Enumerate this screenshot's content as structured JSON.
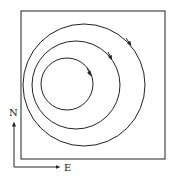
{
  "diagram": {
    "loops": [
      {
        "name": "outer-loop",
        "direction": "clockwise"
      },
      {
        "name": "middle-loop",
        "direction": "clockwise"
      },
      {
        "name": "inner-loop",
        "direction": "clockwise"
      }
    ],
    "compass": {
      "north_label": "N",
      "east_label": "E"
    },
    "colors": {
      "line": "#222222",
      "background": "#ffffff"
    }
  }
}
